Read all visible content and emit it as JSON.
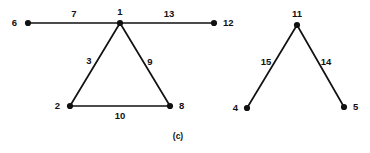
{
  "figure": {
    "caption": "(c)",
    "stroke_color": "#111111",
    "background_color": "#ffffff"
  },
  "chart_data": {
    "type": "diagram",
    "title": "(c)",
    "nodes": [
      {
        "id": "6",
        "label": "6",
        "x": 28,
        "y": 23,
        "label_x": 17,
        "label_y": 26,
        "label_anchor": "end"
      },
      {
        "id": "1",
        "label": "1",
        "x": 120,
        "y": 23,
        "label_x": 120,
        "label_y": 15,
        "label_anchor": "middle"
      },
      {
        "id": "12",
        "label": "12",
        "x": 214,
        "y": 23,
        "label_x": 223,
        "label_y": 26,
        "label_anchor": "start"
      },
      {
        "id": "2",
        "label": "2",
        "x": 70,
        "y": 106,
        "label_x": 60,
        "label_y": 109,
        "label_anchor": "end"
      },
      {
        "id": "8",
        "label": "8",
        "x": 170,
        "y": 106,
        "label_x": 179,
        "label_y": 109,
        "label_anchor": "start"
      },
      {
        "id": "11",
        "label": "11",
        "x": 297,
        "y": 25,
        "label_x": 297,
        "label_y": 17,
        "label_anchor": "middle"
      },
      {
        "id": "4",
        "label": "4",
        "x": 247,
        "y": 108,
        "label_x": 238,
        "label_y": 111,
        "label_anchor": "end"
      },
      {
        "id": "5",
        "label": "5",
        "x": 344,
        "y": 107,
        "label_x": 353,
        "label_y": 110,
        "label_anchor": "start"
      }
    ],
    "edges": [
      {
        "from": "6",
        "to": "1",
        "weight": "7",
        "label_x": 74,
        "label_y": 17,
        "label_anchor": "middle"
      },
      {
        "from": "1",
        "to": "12",
        "weight": "13",
        "label_x": 169,
        "label_y": 17,
        "label_anchor": "middle"
      },
      {
        "from": "1",
        "to": "2",
        "weight": "3",
        "label_x": 89,
        "label_y": 64,
        "label_anchor": "middle"
      },
      {
        "from": "1",
        "to": "8",
        "weight": "9",
        "label_x": 150,
        "label_y": 65,
        "label_anchor": "middle"
      },
      {
        "from": "2",
        "to": "8",
        "weight": "10",
        "label_x": 120,
        "label_y": 119,
        "label_anchor": "middle"
      },
      {
        "from": "11",
        "to": "4",
        "weight": "15",
        "label_x": 266,
        "label_y": 65,
        "label_anchor": "middle"
      },
      {
        "from": "11",
        "to": "5",
        "weight": "14",
        "label_x": 326,
        "label_y": 65,
        "label_anchor": "middle"
      }
    ],
    "node_radius": 3.1,
    "components": [
      {
        "name": "left-component",
        "nodes": [
          "6",
          "1",
          "12",
          "2",
          "8"
        ]
      },
      {
        "name": "right-component",
        "nodes": [
          "11",
          "4",
          "5"
        ]
      }
    ]
  }
}
